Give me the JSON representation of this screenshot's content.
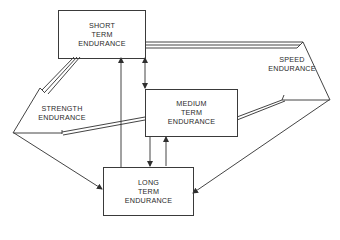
{
  "diagram": {
    "nodes": [
      {
        "id": "short",
        "lines": [
          "SHORT",
          "TERM",
          "ENDURANCE"
        ],
        "shape": "box"
      },
      {
        "id": "medium",
        "lines": [
          "MEDIUM",
          "TERM",
          "ENDURANCE"
        ],
        "shape": "box"
      },
      {
        "id": "long",
        "lines": [
          "LONG",
          "TERM",
          "ENDURANCE"
        ],
        "shape": "box"
      },
      {
        "id": "strength",
        "lines": [
          "STRENGTH",
          "ENDURANCE"
        ],
        "shape": "triangle"
      },
      {
        "id": "speed",
        "lines": [
          "SPEED",
          "ENDURANCE"
        ],
        "shape": "triangle"
      }
    ],
    "edges": [
      {
        "from": "strength",
        "to": "short",
        "style": "triple-line"
      },
      {
        "from": "strength",
        "to": "medium",
        "style": "double-line"
      },
      {
        "from": "strength",
        "to": "long",
        "style": "single-arrow"
      },
      {
        "from": "speed",
        "to": "short",
        "style": "triple-line"
      },
      {
        "from": "speed",
        "to": "medium",
        "style": "double-line"
      },
      {
        "from": "speed",
        "to": "long",
        "style": "single-arrow"
      },
      {
        "from": "long",
        "to": "short",
        "style": "single-arrow"
      },
      {
        "from": "short",
        "to": "medium",
        "style": "bidirectional-arrow"
      },
      {
        "from": "medium",
        "to": "long",
        "style": "bidirectional-arrow"
      }
    ],
    "line_color": "#2f2f2f"
  }
}
